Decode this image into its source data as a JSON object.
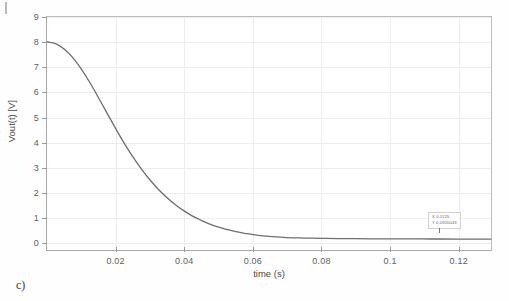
{
  "figure": {
    "caption": "c)",
    "background": "#ffffff",
    "curve_color": "#6e6e6e",
    "grid_color": "#ededed",
    "axis_color": "#a9a9a9"
  },
  "datatip": {
    "x_label": "X 0.1125",
    "y_label": "Y 0.0920043"
  },
  "chart_data": {
    "type": "line",
    "title": "",
    "xlabel": "time (s)",
    "ylabel": "Vout(t) [V]",
    "xlim": [
      0,
      0.13
    ],
    "ylim": [
      -0.35,
      9
    ],
    "grid": true,
    "legend": null,
    "xticks": [
      0.02,
      0.04,
      0.06,
      0.08,
      0.1,
      0.12
    ],
    "xticklabels": [
      "0.02",
      "0.04",
      "0.06",
      "0.08",
      "0.1",
      "0.12"
    ],
    "yticks": [
      0,
      1,
      2,
      3,
      4,
      5,
      6,
      7,
      8,
      9
    ],
    "yticklabels": [
      "0",
      "1",
      "2",
      "3",
      "4",
      "5",
      "6",
      "7",
      "8",
      "9"
    ],
    "annotations": [
      {
        "type": "datatip",
        "x": 0.1125,
        "y": 0.0920043,
        "text": "X 0.1125 / Y 0.0920043"
      }
    ],
    "series": [
      {
        "name": "Vout(t)",
        "color": "#6e6e6e",
        "linewidth": 1.3,
        "x": [
          0,
          0.0025,
          0.005,
          0.0075,
          0.01,
          0.0125,
          0.015,
          0.0175,
          0.02,
          0.0225,
          0.025,
          0.0275,
          0.03,
          0.0325,
          0.035,
          0.0375,
          0.04,
          0.0425,
          0.045,
          0.0475,
          0.05,
          0.0525,
          0.055,
          0.0575,
          0.06,
          0.0625,
          0.065,
          0.07,
          0.075,
          0.08,
          0.085,
          0.09,
          0.095,
          0.1,
          0.105,
          0.1125,
          0.12,
          0.125,
          0.13
        ],
        "y": [
          8.0,
          7.93,
          7.72,
          7.38,
          6.92,
          6.38,
          5.78,
          5.16,
          4.55,
          3.96,
          3.42,
          2.93,
          2.49,
          2.1,
          1.77,
          1.48,
          1.23,
          1.02,
          0.85,
          0.7,
          0.58,
          0.48,
          0.4,
          0.33,
          0.28,
          0.23,
          0.2,
          0.15,
          0.13,
          0.12,
          0.11,
          0.105,
          0.1,
          0.097,
          0.094,
          0.092,
          0.09,
          0.089,
          0.088
        ]
      }
    ]
  }
}
